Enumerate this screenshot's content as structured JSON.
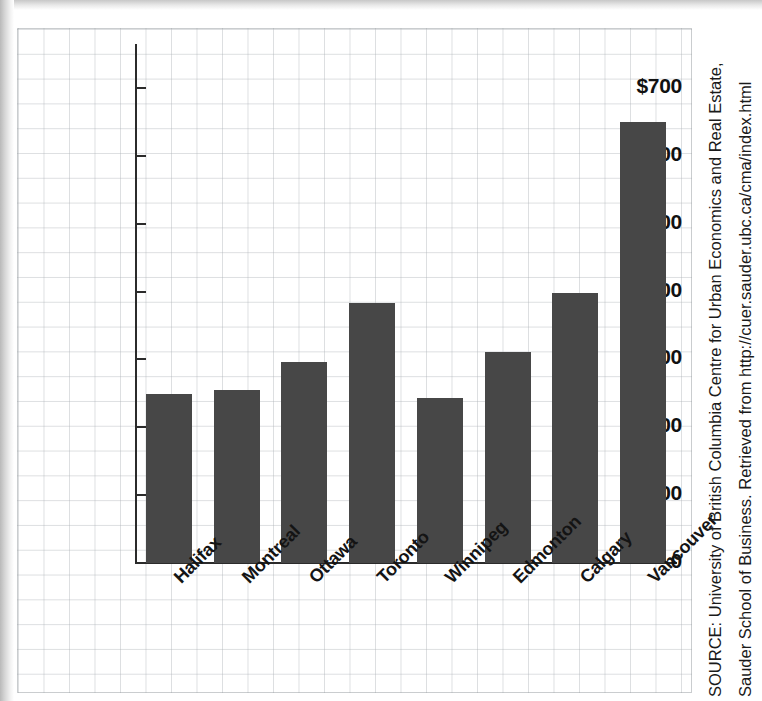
{
  "chart_data": {
    "type": "bar",
    "title": "",
    "xlabel": "",
    "ylabel": "",
    "categories": [
      "Halifax",
      "Montreal",
      "Ottawa",
      "Toronto",
      "Winnipeg",
      "Edmonton",
      "Calgary",
      "Vancouver"
    ],
    "values": [
      249,
      255,
      296,
      383,
      243,
      311,
      398,
      650
    ],
    "ylim": [
      0,
      730
    ],
    "ytick_values": [
      0,
      100,
      200,
      300,
      400,
      500,
      600,
      700
    ],
    "ytick_labels": [
      "0",
      "100",
      "200",
      "300",
      "400",
      "500",
      "600",
      "$700"
    ],
    "grid": true,
    "legend": null,
    "bar_color": "#474747",
    "axis_color": "#2b2b2b"
  },
  "source": {
    "line1": "SOURCE: University of British Columbia Centre for Urban Economics and Real Estate,",
    "line2": "Sauder School of Business. Retrieved from http://cuer.sauder.ubc.ca/cma/index.html"
  }
}
